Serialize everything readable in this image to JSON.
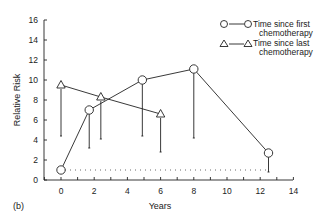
{
  "chart_data": {
    "type": "line",
    "panel_label": "(b)",
    "title": "",
    "xlabel": "Years",
    "ylabel": "Relative Risk",
    "xlim": [
      -1,
      14
    ],
    "ylim": [
      0,
      16
    ],
    "xticks": [
      0,
      2,
      4,
      6,
      8,
      10,
      12,
      14
    ],
    "yticks": [
      0,
      2,
      4,
      6,
      8,
      10,
      12,
      14,
      16
    ],
    "grid": false,
    "legend_position": "upper right",
    "reference_line": {
      "y": 1,
      "style": "dotted"
    },
    "series": [
      {
        "name": "Time since first chemotherapy",
        "marker": "circle",
        "x": [
          0,
          1.7,
          4.9,
          8,
          12.5
        ],
        "y": [
          1,
          7,
          10,
          11.1,
          2.7
        ],
        "lower": [
          1,
          3.2,
          4.4,
          4.2,
          0.8
        ]
      },
      {
        "name": "Time since last chemotherapy",
        "marker": "triangle",
        "x": [
          0,
          2.4,
          6
        ],
        "y": [
          9.5,
          8.3,
          6.6
        ],
        "lower": [
          4.4,
          4.1,
          2.8
        ]
      }
    ]
  },
  "legend": {
    "entries": [
      {
        "line1": "Time since first",
        "line2": "chemotherapy"
      },
      {
        "line1": "Time since last",
        "line2": "chemotherapy"
      }
    ]
  }
}
